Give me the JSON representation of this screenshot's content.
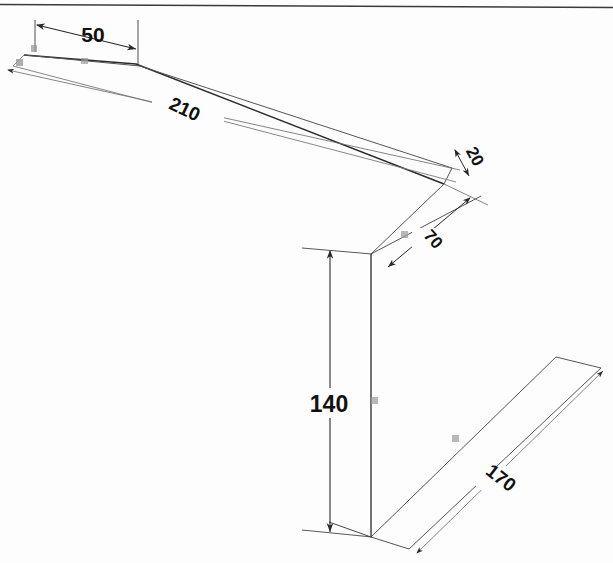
{
  "drawing": {
    "title": "Isometric dimensioned L-bracket sketch",
    "type": "engineering-drawing",
    "background_color": "#fdfdfd",
    "line_color": "#2a2a2a",
    "thin_line_color": "#6d6d6d",
    "text_color": "#111111",
    "border": {
      "top_rule": true
    },
    "dimensions": [
      {
        "id": "dim-50",
        "label": "50",
        "x": 93,
        "y": 42,
        "rotation": 0,
        "font_size": 21,
        "orientation": "horizontal",
        "location": "top-left upper beam"
      },
      {
        "id": "dim-210",
        "label": "210",
        "x": 182,
        "y": 115,
        "rotation": 25,
        "font_size": 19,
        "orientation": "slanted",
        "location": "long upper beam"
      },
      {
        "id": "dim-20",
        "label": "20",
        "x": 470,
        "y": 159,
        "rotation": 62,
        "font_size": 17,
        "orientation": "slanted",
        "location": "right end of upper beam"
      },
      {
        "id": "dim-70",
        "label": "70",
        "x": 429,
        "y": 241,
        "rotation": 48,
        "font_size": 17,
        "orientation": "slanted",
        "location": "upper right depth face"
      },
      {
        "id": "dim-140",
        "label": "140",
        "x": 327,
        "y": 406,
        "rotation": 0,
        "font_size": 23,
        "orientation": "vertical-dimension",
        "location": "vertical column height"
      },
      {
        "id": "dim-170",
        "label": "170",
        "x": 497,
        "y": 481,
        "rotation": 38,
        "font_size": 19,
        "orientation": "slanted",
        "location": "lower right base"
      }
    ],
    "tiny_marks": [
      {
        "id": "mark-a",
        "x": 33,
        "y": 48,
        "note": "small illegible annotation near origin"
      },
      {
        "id": "mark-b",
        "x": 18,
        "y": 62,
        "note": "small illegible annotation near origin"
      },
      {
        "id": "mark-c",
        "x": 84,
        "y": 61,
        "note": "small illegible annotation on upper beam"
      },
      {
        "id": "mark-d",
        "x": 404,
        "y": 234,
        "note": "small illegible annotation on depth face"
      },
      {
        "id": "mark-e",
        "x": 374,
        "y": 400,
        "note": "small illegible annotation on vertical edge"
      },
      {
        "id": "mark-f",
        "x": 455,
        "y": 438,
        "note": "small illegible annotation on base face"
      }
    ]
  }
}
